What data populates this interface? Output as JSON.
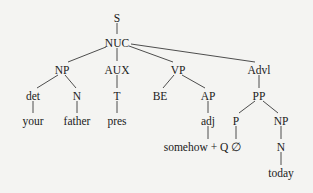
{
  "diagram": {
    "type": "syntax-tree",
    "nodes": {
      "S": {
        "label": "S",
        "x": 117,
        "y": 19
      },
      "NUC": {
        "label": "NUC",
        "x": 117,
        "y": 44
      },
      "NP1": {
        "label": "NP",
        "x": 62,
        "y": 71
      },
      "AUX": {
        "label": "AUX",
        "x": 117,
        "y": 71
      },
      "VP": {
        "label": "VP",
        "x": 178,
        "y": 71
      },
      "Advl": {
        "label": "Advl",
        "x": 259,
        "y": 71
      },
      "det": {
        "label": "det",
        "x": 33,
        "y": 97
      },
      "N1": {
        "label": "N",
        "x": 77,
        "y": 97
      },
      "T": {
        "label": "T",
        "x": 117,
        "y": 97
      },
      "BE": {
        "label": "BE",
        "x": 160,
        "y": 97
      },
      "AP": {
        "label": "AP",
        "x": 208,
        "y": 97
      },
      "PP": {
        "label": "PP",
        "x": 259,
        "y": 97
      },
      "your": {
        "label": "your",
        "x": 33,
        "y": 122
      },
      "father": {
        "label": "father",
        "x": 77,
        "y": 122
      },
      "pres": {
        "label": "pres",
        "x": 117,
        "y": 122
      },
      "adj": {
        "label": "adj",
        "x": 208,
        "y": 122
      },
      "P": {
        "label": "P",
        "x": 236,
        "y": 122
      },
      "NP2": {
        "label": "NP",
        "x": 281,
        "y": 122
      },
      "somehowQ": {
        "label": "somehow + Q",
        "x": 196,
        "y": 148
      },
      "empty": {
        "label": "∅",
        "x": 236,
        "y": 148
      },
      "N2": {
        "label": "N",
        "x": 281,
        "y": 148
      },
      "today": {
        "label": "today",
        "x": 281,
        "y": 174
      }
    },
    "edges": [
      [
        "S",
        "NUC"
      ],
      [
        "NUC",
        "NP1"
      ],
      [
        "NUC",
        "AUX"
      ],
      [
        "NUC",
        "VP"
      ],
      [
        "NUC",
        "Advl"
      ],
      [
        "NP1",
        "det"
      ],
      [
        "NP1",
        "N1"
      ],
      [
        "AUX",
        "T"
      ],
      [
        "VP",
        "BE"
      ],
      [
        "VP",
        "AP"
      ],
      [
        "Advl",
        "PP"
      ],
      [
        "det",
        "your"
      ],
      [
        "N1",
        "father"
      ],
      [
        "T",
        "pres"
      ],
      [
        "AP",
        "adj"
      ],
      [
        "adj",
        "somehowQ"
      ],
      [
        "PP",
        "P"
      ],
      [
        "PP",
        "NP2"
      ],
      [
        "P",
        "empty"
      ],
      [
        "NP2",
        "N2"
      ],
      [
        "N2",
        "today"
      ]
    ]
  }
}
